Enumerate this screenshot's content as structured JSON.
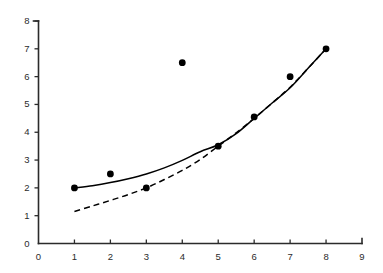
{
  "chart_data": {
    "type": "scatter",
    "title": "",
    "subtitle": "",
    "xlabel": "",
    "ylabel": "",
    "xlim": [
      0,
      9
    ],
    "ylim": [
      0,
      8
    ],
    "xticks": [
      0,
      1,
      2,
      3,
      4,
      5,
      6,
      7,
      8,
      9
    ],
    "yticks": [
      0,
      1,
      2,
      3,
      4,
      5,
      6,
      7,
      8
    ],
    "xtick_labels": [
      "0",
      "1",
      "2",
      "3",
      "4",
      "5",
      "6",
      "7",
      "8",
      "9"
    ],
    "ytick_labels": [
      "0",
      "1",
      "2",
      "3",
      "4",
      "5",
      "6",
      "7",
      "8"
    ],
    "grid": false,
    "legend": null,
    "annotations": [],
    "points": {
      "name": "observations",
      "marker": "filled-circle",
      "color": "#000000",
      "x": [
        1,
        2,
        3,
        4,
        5,
        6,
        7,
        8
      ],
      "y": [
        2.0,
        2.5,
        2.0,
        6.5,
        3.5,
        4.55,
        6.0,
        7.0
      ]
    },
    "series": [
      {
        "name": "fit-solid",
        "type": "line",
        "style": "solid",
        "color": "#000000",
        "x": [
          1.0,
          1.5,
          2.0,
          2.5,
          3.0,
          3.5,
          4.0,
          4.5,
          5.0,
          5.5,
          6.0,
          6.5,
          7.0,
          7.5,
          8.0
        ],
        "y": [
          2.0,
          2.08,
          2.19,
          2.33,
          2.5,
          2.72,
          2.99,
          3.3,
          3.55,
          3.95,
          4.5,
          5.05,
          5.6,
          6.3,
          7.0
        ]
      },
      {
        "name": "fit-dashed",
        "type": "line",
        "style": "dashed",
        "color": "#000000",
        "x": [
          1.0,
          1.5,
          2.0,
          2.5,
          3.0,
          3.5,
          4.0,
          4.5,
          5.0,
          5.5,
          6.0,
          6.5,
          7.0,
          7.5,
          8.0
        ],
        "y": [
          1.15,
          1.35,
          1.55,
          1.76,
          2.0,
          2.3,
          2.63,
          3.02,
          3.5,
          3.98,
          4.5,
          5.05,
          5.62,
          6.3,
          7.0
        ]
      }
    ]
  }
}
